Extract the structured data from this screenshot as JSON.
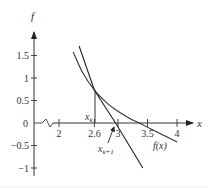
{
  "chart_data": {
    "type": "line",
    "title": "",
    "xlabel": "x",
    "ylabel": "f",
    "xlim": [
      1.5,
      4.3
    ],
    "ylim": [
      -1.1,
      1.9
    ],
    "x_axis_break": true,
    "grid": false,
    "x_ticks": [
      2,
      2.6,
      3,
      3.5,
      4
    ],
    "x_tick_labels": [
      "2",
      "2.6",
      "3",
      "3.5",
      "4"
    ],
    "y_ticks": [
      1.5,
      1,
      0.5,
      0,
      -0.5,
      -1
    ],
    "y_tick_labels": [
      "1.5",
      "1",
      "0.5",
      "0",
      "−0.5",
      "−1"
    ],
    "series": [
      {
        "name": "f(x)",
        "kind": "curve",
        "x": [
          2.24,
          2.4,
          2.6,
          2.8,
          3.0,
          3.2,
          3.36,
          3.6,
          3.8,
          4.0
        ],
        "y": [
          1.58,
          1.12,
          0.73,
          0.46,
          0.26,
          0.1,
          0.0,
          -0.16,
          -0.29,
          -0.42
        ]
      },
      {
        "name": "tangent at x_k",
        "kind": "line",
        "x": [
          2.34,
          2.6,
          2.96,
          3.42
        ],
        "y": [
          1.71,
          0.73,
          0.0,
          -1.0
        ]
      }
    ],
    "annotations": [
      {
        "text": "x_k",
        "x": 2.6,
        "y": 0.73,
        "note": "vertical line from curve to x-axis"
      },
      {
        "text": "x_{k+1}",
        "x": 2.96,
        "y": 0,
        "note": "arrow to tangent x-intercept"
      },
      {
        "text": "f(x)",
        "x": 3.75,
        "y": -0.5,
        "note": "curve label"
      }
    ]
  },
  "labels": {
    "y_axis": "f",
    "x_axis": "x",
    "xk_main": "x",
    "xk_sub": "k",
    "xk1_main": "x",
    "xk1_sub": "k+1",
    "fx": "f(x)"
  }
}
